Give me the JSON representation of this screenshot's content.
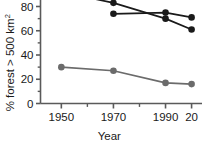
{
  "chart_data": {
    "type": "line",
    "title": "",
    "subtitle": "",
    "xlabel": "Year",
    "ylabel": "% forest > 500 km",
    "ylabel_superscript": "2",
    "xlim": [
      1942,
      2004
    ],
    "ylim": [
      0,
      88
    ],
    "x_ticks": [
      1950,
      1970,
      1990,
      2000
    ],
    "x_tick_labels": [
      "1950",
      "1970",
      "1990",
      "20"
    ],
    "x_minor_ticks": [
      1960,
      1980
    ],
    "y_ticks": [
      0,
      20,
      40,
      60,
      80
    ],
    "y_tick_labels": [
      "0",
      "20",
      "40",
      "60",
      "80"
    ],
    "y_minor_ticks": [
      10,
      30,
      50,
      70
    ],
    "grid": false,
    "legend": "none",
    "note": "Image is cropped: top of plot and rightmost x tick label are cut off at the frame edges.",
    "series": [
      {
        "name": "series-1-dark-upper",
        "color": "#1a1a1a",
        "marker": "circle-filled",
        "x": [
          1950,
          1970,
          1990,
          2000
        ],
        "values": [
          92,
          83,
          70,
          61
        ]
      },
      {
        "name": "series-2-dark-lower",
        "color": "#1a1a1a",
        "marker": "circle-filled",
        "x": [
          1970,
          1990,
          2000
        ],
        "values": [
          74,
          75,
          71
        ]
      },
      {
        "name": "series-3-gray",
        "color": "#6b6b6b",
        "marker": "circle-filled",
        "x": [
          1950,
          1970,
          1990,
          2000
        ],
        "values": [
          30,
          27,
          17,
          16
        ]
      }
    ]
  },
  "axes": {
    "y_axis_name": "y-axis",
    "x_axis_name": "x-axis"
  },
  "colors": {
    "dark_series": "#1a1a1a",
    "gray_series": "#6b6b6b",
    "axis": "#5a5a5a",
    "text": "#1a1a1a",
    "background": "#ffffff"
  }
}
